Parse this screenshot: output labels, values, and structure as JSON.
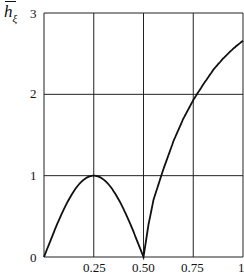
{
  "chart_data": {
    "type": "line",
    "title": "",
    "xlabel": "",
    "ylabel": "h̄_ξ",
    "ylabel_main": "h",
    "ylabel_sub": "ξ",
    "xlim": [
      0,
      1
    ],
    "ylim": [
      0,
      3
    ],
    "grid": true,
    "x_ticks": [
      "0.25",
      "0.50",
      "0.75",
      "1"
    ],
    "y_ticks": [
      "0",
      "1",
      "2",
      "3"
    ],
    "series": [
      {
        "name": "h_xi",
        "x": [
          0,
          0.025,
          0.05,
          0.1,
          0.15,
          0.2,
          0.25,
          0.3,
          0.35,
          0.4,
          0.45,
          0.475,
          0.5,
          0.525,
          0.55,
          0.6,
          0.65,
          0.7,
          0.75,
          0.8,
          0.85,
          0.9,
          0.95,
          1.0
        ],
        "values": [
          0,
          0.31,
          0.59,
          0.81,
          0.95,
          1.0,
          1.0,
          0.95,
          0.81,
          0.59,
          0.31,
          0.16,
          0,
          0.4,
          0.7,
          1.08,
          1.42,
          1.7,
          1.93,
          2.12,
          2.3,
          2.44,
          2.56,
          2.66
        ]
      }
    ],
    "legend": []
  }
}
